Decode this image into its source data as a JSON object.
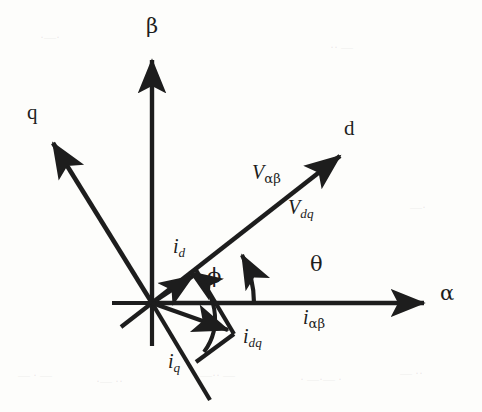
{
  "figure": {
    "background_color": "#fdfdfb",
    "stroke_color": "#1d1d1d"
  },
  "axes": [
    {
      "id": "alpha",
      "label": "α",
      "kind": "stationary-frame-axis",
      "angle_deg": 0,
      "origin": [
        152,
        303
      ],
      "tip": [
        430,
        303
      ],
      "label_pos": [
        440,
        291
      ]
    },
    {
      "id": "beta",
      "label": "β",
      "kind": "stationary-frame-axis",
      "angle_deg": 90,
      "origin": [
        152,
        303
      ],
      "tip": [
        152,
        52
      ],
      "label_pos": [
        145,
        20
      ]
    },
    {
      "id": "d",
      "label": "d",
      "kind": "rotating-frame-axis",
      "angle_deg": 28,
      "origin": [
        152,
        303
      ],
      "tip": [
        345,
        152
      ],
      "label_pos": [
        344,
        120
      ]
    },
    {
      "id": "q",
      "label": "q",
      "kind": "rotating-frame-axis",
      "angle_deg": 118,
      "origin": [
        152,
        303
      ],
      "tip": [
        48,
        137
      ],
      "label_pos": [
        28,
        104
      ]
    }
  ],
  "vectors": [
    {
      "id": "V_alphabeta",
      "label_base": "V",
      "label_sub": "αβ",
      "sub_style": "greek",
      "description": "voltage vector in stationary frame",
      "label_pos": [
        253,
        163
      ],
      "tip": [
        258,
        218
      ]
    },
    {
      "id": "V_dq",
      "label_base": "V",
      "label_sub": "dq",
      "sub_style": "italic",
      "description": "voltage vector in rotating frame",
      "label_pos": [
        288,
        198
      ],
      "tip": [
        252,
        219
      ]
    },
    {
      "id": "i_alphabeta",
      "label_base": "i",
      "label_sub": "αβ",
      "sub_style": "greek",
      "description": "current vector in stationary frame",
      "label_pos": [
        303,
        308
      ]
    },
    {
      "id": "i_dq",
      "label_base": "i",
      "label_sub": "dq",
      "sub_style": "italic",
      "description": "current vector in rotating frame",
      "label_pos": [
        243,
        328
      ],
      "tip": [
        233,
        333
      ]
    },
    {
      "id": "i_d",
      "label_base": "i",
      "label_sub": "d",
      "sub_style": "italic",
      "description": "d-axis component of current",
      "label_pos": [
        174,
        238
      ],
      "tip": [
        196,
        273
      ]
    },
    {
      "id": "i_q",
      "label_base": "i",
      "label_sub": "q",
      "sub_style": "italic",
      "description": "q-axis component of current",
      "label_pos": [
        168,
        352
      ]
    }
  ],
  "angles": [
    {
      "id": "theta",
      "label": "θ",
      "description": "angle between alpha axis and d axis",
      "label_pos": [
        309,
        254
      ],
      "from_deg": 0,
      "to_deg": 28,
      "radius": 102
    },
    {
      "id": "phi",
      "label": "ϕ",
      "description": "angle between current vector i_dq and d axis",
      "label_pos": [
        208,
        268
      ],
      "from_deg": -28,
      "to_deg": 28,
      "radius": 56
    }
  ],
  "scan_artifacts": [
    {
      "text": "— · —",
      "pos": [
        18,
        368
      ]
    },
    {
      "text": "·— ··",
      "pos": [
        96,
        374
      ]
    },
    {
      "text": "—·· —",
      "pos": [
        200,
        368
      ]
    },
    {
      "text": "· —·— ·",
      "pos": [
        300,
        372
      ]
    },
    {
      "text": "— ··",
      "pos": [
        400,
        366
      ]
    },
    {
      "text": "·—·",
      "pos": [
        40,
        30
      ]
    },
    {
      "text": "·· —",
      "pos": [
        330,
        40
      ]
    },
    {
      "text": "—·",
      "pos": [
        410,
        200
      ]
    }
  ]
}
